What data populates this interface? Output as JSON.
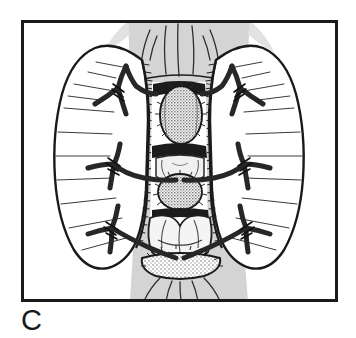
{
  "figure": {
    "panel_label": "C",
    "caption_text": "",
    "illustration_type": "line-drawing",
    "frame": {
      "x": 21,
      "y": 20,
      "width": 317,
      "height": 282,
      "stroke_color": "#1a1a1a",
      "stroke_width": 3,
      "fill_color": "#ffffff"
    },
    "background_band": {
      "name": "shaded-tissue-band",
      "fill_color": "#d4d4d4",
      "top_width": 122,
      "bottom_width": 118
    },
    "colors": {
      "ink": "#1a1a1a",
      "suture": "#2b2b2b",
      "shade_gray": "#d4d4d4",
      "stipple_gray": "#8a8a8a",
      "paper": "#ffffff"
    },
    "lobes": [
      {
        "name": "left-retracted-lobe",
        "side": "left",
        "hatch_line_count": 9
      },
      {
        "name": "right-retracted-lobe",
        "side": "right",
        "hatch_line_count": 9
      }
    ],
    "sutures": [
      {
        "name": "suture-upper-left",
        "side": "left",
        "row": 1,
        "cx": 118,
        "cy": 88
      },
      {
        "name": "suture-upper-right",
        "side": "right",
        "row": 1,
        "cx": 238,
        "cy": 88
      },
      {
        "name": "suture-middle-left",
        "side": "left",
        "row": 2,
        "cx": 112,
        "cy": 166
      },
      {
        "name": "suture-middle-right",
        "side": "right",
        "row": 2,
        "cx": 242,
        "cy": 166
      },
      {
        "name": "suture-lower-left",
        "side": "left",
        "row": 3,
        "cx": 110,
        "cy": 228
      },
      {
        "name": "suture-lower-right",
        "side": "right",
        "row": 3,
        "cx": 245,
        "cy": 228
      }
    ],
    "nodules": [
      {
        "name": "nodule-upper",
        "cx": 181,
        "cy": 113,
        "rx": 21,
        "ry": 28
      },
      {
        "name": "nodule-middle",
        "cx": 180,
        "cy": 190,
        "rx": 21,
        "ry": 18
      },
      {
        "name": "nodule-lower-rim",
        "cx": 181,
        "cy": 262,
        "rx": 40,
        "ry": 11
      }
    ]
  }
}
